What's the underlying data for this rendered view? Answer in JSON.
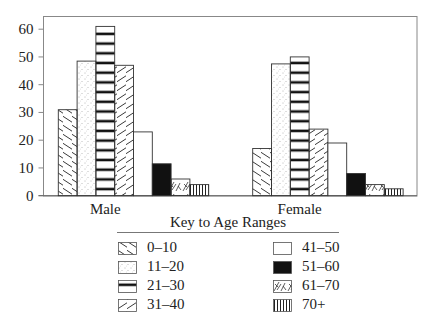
{
  "chart_data": {
    "type": "bar",
    "title": "",
    "xlabel": "",
    "ylabel": "",
    "categories": [
      "Male",
      "Female"
    ],
    "series": [
      {
        "name": "0–10",
        "pattern": "diag-down",
        "values": [
          31,
          17
        ]
      },
      {
        "name": "11–20",
        "pattern": "dots",
        "values": [
          48.5,
          47.5
        ]
      },
      {
        "name": "21–30",
        "pattern": "hlines",
        "values": [
          61,
          50
        ]
      },
      {
        "name": "31–40",
        "pattern": "diag-up",
        "values": [
          47,
          24
        ]
      },
      {
        "name": "41–50",
        "pattern": "blank",
        "values": [
          23,
          19
        ]
      },
      {
        "name": "51–60",
        "pattern": "solid",
        "values": [
          11.5,
          8
        ]
      },
      {
        "name": "61–70",
        "pattern": "scribble",
        "values": [
          6,
          4
        ]
      },
      {
        "name": "70+",
        "pattern": "vlines",
        "values": [
          4,
          2.5
        ]
      }
    ],
    "ylim": [
      0,
      65
    ],
    "yticks": [
      0,
      10,
      20,
      30,
      40,
      50,
      60
    ],
    "grid": false,
    "legend": {
      "title": "Key to Age Ranges",
      "position": "bottom",
      "columns": 2,
      "entries": [
        "0–10",
        "11–20",
        "21–30",
        "31–40",
        "41–50",
        "51–60",
        "61–70",
        "70+"
      ]
    }
  },
  "legend_title": "Key to Age Ranges",
  "colors": {
    "ink": "#222222",
    "frame": "#888888",
    "solid": "#111111",
    "background": "#ffffff"
  }
}
